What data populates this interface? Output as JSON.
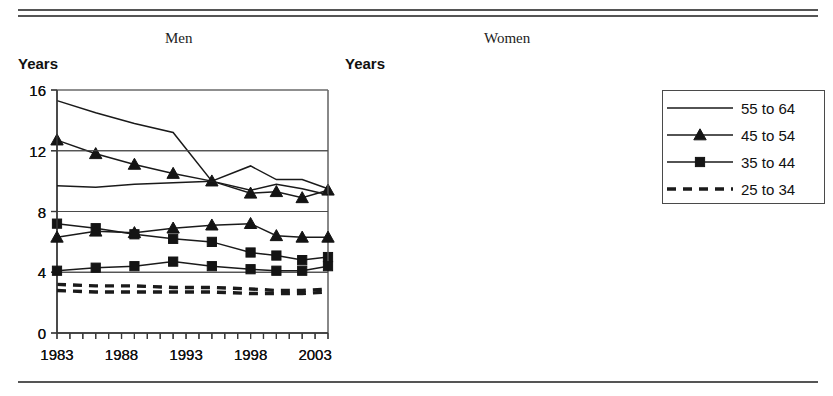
{
  "figure": {
    "rules": {
      "top_double": true,
      "bottom_single": true
    },
    "panels": [
      {
        "key": "men",
        "title": "Men",
        "y_axis_title": "Years"
      },
      {
        "key": "women",
        "title": "Women",
        "y_axis_title": "Years"
      }
    ],
    "legend": {
      "entries": [
        {
          "label": "55 to 64",
          "style": "solid",
          "marker": "none"
        },
        {
          "label": "45 to 54",
          "style": "solid",
          "marker": "triangle"
        },
        {
          "label": "35 to 44",
          "style": "solid",
          "marker": "square"
        },
        {
          "label": "25 to 34",
          "style": "dashed",
          "marker": "none"
        }
      ]
    }
  },
  "chart_data": [
    {
      "type": "line",
      "title": "Men",
      "xlabel": "",
      "ylabel": "Years",
      "ylim": [
        0,
        16
      ],
      "yticks": [
        0,
        4,
        8,
        12,
        16
      ],
      "xlim": [
        1983,
        2004
      ],
      "xticks": [
        1983,
        1988,
        1993,
        1998,
        2003
      ],
      "xtick_labels": [
        "1983",
        "1988",
        "1993",
        "1998",
        "2003"
      ],
      "grid": true,
      "legend_position": "right-outside",
      "x": [
        1983,
        1984,
        1985,
        1986,
        1987,
        1988,
        1989,
        1990,
        1991,
        1992,
        1993,
        1994,
        1995,
        1996,
        1997,
        1998,
        1999,
        2000,
        2001,
        2002,
        2003,
        2004
      ],
      "series": [
        {
          "name": "55 to 64",
          "marker": "none",
          "style": "solid",
          "x": [
            1983,
            1986,
            1989,
            1992,
            1995,
            1998,
            2000,
            2002,
            2004
          ],
          "values": [
            15.3,
            14.5,
            13.8,
            13.2,
            10.0,
            11.0,
            10.1,
            10.1,
            9.5
          ]
        },
        {
          "name": "45 to 54",
          "marker": "triangle",
          "style": "solid",
          "x": [
            1983,
            1986,
            1989,
            1992,
            1995,
            1998,
            2000,
            2002,
            2004
          ],
          "values": [
            12.7,
            11.8,
            11.1,
            10.5,
            10.0,
            9.2,
            9.3,
            8.9,
            9.4
          ]
        },
        {
          "name": "35 to 44",
          "marker": "square",
          "style": "solid",
          "x": [
            1983,
            1986,
            1989,
            1992,
            1995,
            1998,
            2000,
            2002,
            2004
          ],
          "values": [
            7.2,
            6.9,
            6.5,
            6.2,
            6.0,
            5.3,
            5.1,
            4.8,
            5.0
          ]
        },
        {
          "name": "25 to 34",
          "marker": "none",
          "style": "dashed",
          "x": [
            1983,
            1986,
            1989,
            1992,
            1995,
            1998,
            2000,
            2002,
            2004
          ],
          "values": [
            3.2,
            3.1,
            3.1,
            3.0,
            3.0,
            2.9,
            2.8,
            2.8,
            2.9
          ]
        }
      ]
    },
    {
      "type": "line",
      "title": "Women",
      "xlabel": "",
      "ylabel": "Years",
      "ylim": [
        0,
        16
      ],
      "yticks": [
        0,
        4,
        8,
        12,
        16
      ],
      "xlim": [
        1983,
        2004
      ],
      "xticks": [
        1983,
        1988,
        1993,
        1998,
        2003
      ],
      "xtick_labels": [
        "1983",
        "1988",
        "1993",
        "1998",
        "2003"
      ],
      "grid": true,
      "legend_position": "right-outside",
      "x": [
        1983,
        1984,
        1985,
        1986,
        1987,
        1988,
        1989,
        1990,
        1991,
        1992,
        1993,
        1994,
        1995,
        1996,
        1997,
        1998,
        1999,
        2000,
        2001,
        2002,
        2003,
        2004
      ],
      "series": [
        {
          "name": "55 to 64",
          "marker": "none",
          "style": "solid",
          "x": [
            1983,
            1986,
            1989,
            1992,
            1995,
            1998,
            2000,
            2002,
            2004
          ],
          "values": [
            9.7,
            9.6,
            9.8,
            9.9,
            10.0,
            9.4,
            9.8,
            9.5,
            9.1
          ]
        },
        {
          "name": "45 to 54",
          "marker": "triangle",
          "style": "solid",
          "x": [
            1983,
            1986,
            1989,
            1992,
            1995,
            1998,
            2000,
            2002,
            2004
          ],
          "values": [
            6.3,
            6.7,
            6.6,
            6.9,
            7.1,
            7.2,
            6.4,
            6.3,
            6.3
          ]
        },
        {
          "name": "35 to 44",
          "marker": "square",
          "style": "solid",
          "x": [
            1983,
            1986,
            1989,
            1992,
            1995,
            1998,
            2000,
            2002,
            2004
          ],
          "values": [
            4.1,
            4.3,
            4.4,
            4.7,
            4.4,
            4.2,
            4.1,
            4.1,
            4.4
          ]
        },
        {
          "name": "25 to 34",
          "marker": "none",
          "style": "dashed",
          "x": [
            1983,
            1986,
            1989,
            1992,
            1995,
            1998,
            2000,
            2002,
            2004
          ],
          "values": [
            2.8,
            2.7,
            2.7,
            2.7,
            2.7,
            2.6,
            2.6,
            2.6,
            2.7
          ]
        }
      ]
    }
  ]
}
